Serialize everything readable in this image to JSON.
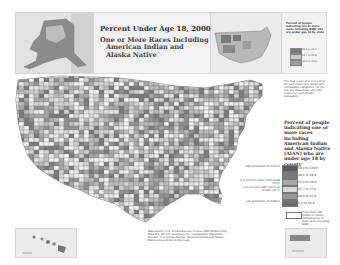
{
  "title": "Percent Under Age 18, 2000",
  "subtitle_lines": [
    "One or More Races Including",
    "American Indian and",
    "Alaska Native"
  ],
  "legend": {
    "heading": "Percent of people indicating one or more races including American Indian and Alaska Native (AIAN) who are under age 18 by county",
    "bins": [
      {
        "label": "50.0 to 100.0",
        "color": "#5a5a5a",
        "note": "High proportion of children"
      },
      {
        "label": "40.0 to 49.9",
        "color": "#7a7a7a",
        "note": ""
      },
      {
        "label": "33.9 to 39.9",
        "color": "#a8a8a8",
        "note": "U.S. percent under 18 for AIAN (33.9)"
      },
      {
        "label": "25.7 to 33.8",
        "color": "#d8d8d8",
        "note": "U.S. percent under 18 for all people (25.7)"
      },
      {
        "label": "20.0 to 25.6",
        "color": "#9a9a9a",
        "note": ""
      },
      {
        "label": "0.0 to 19.9",
        "color": "#6e6e6e",
        "note": "Low proportion of children"
      }
    ],
    "no_data_note": "Fewer than 100 people in county indicating one or more races including AIAN"
  },
  "inset_legend": {
    "heading": "Percent of people indicating one or more races including AIAN who are under age 18 by state",
    "bins": [
      {
        "label": "33.9 to 45.1",
        "color": "#7a7a7a"
      },
      {
        "label": "25.7 to 33.8",
        "color": "#c8c8c8"
      },
      {
        "label": "19.3 to 25.6",
        "color": "#9c9c9c"
      }
    ],
    "markers": [
      "Nationwide",
      "U.S. percent under 18 for all people (25.7)"
    ]
  },
  "side_note": "The map is one of a series of 12 for each major race group with comparable categories. For the U.S. the data shown are with respect to each group's population.",
  "source_note": "Data Source: U.S. Census Bureau, Census 2000 Redistricting Data (P.L. 94-171) Summary File. Cartography: Population Division, U.S. Census Bureau. American Indian and Alaska Native areas shown in this map.",
  "insets": [
    "Alaska",
    "Hawaii",
    "Puerto Rico"
  ]
}
